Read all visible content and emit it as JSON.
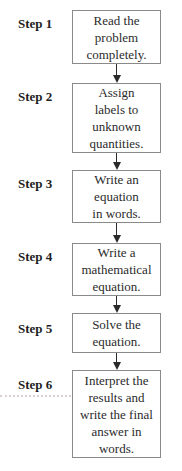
{
  "figure": {
    "type": "flowchart",
    "direction": "top-down"
  },
  "colors": {
    "background": "#ffffff",
    "box_border": "#8a8a8a",
    "text": "#2b2b2b",
    "label_text": "#1e1e1e",
    "arrow": "#2b2b2b",
    "dotted_rule": "#ddcfcf"
  },
  "steps": [
    {
      "label": "Step 1",
      "text": "Read the\nproblem\ncompletely."
    },
    {
      "label": "Step 2",
      "text": "Assign\nlabels to\nunknown\nquantities."
    },
    {
      "label": "Step 3",
      "text": "Write an\nequation\nin words."
    },
    {
      "label": "Step 4",
      "text": "Write a\nmathematical\nequation."
    },
    {
      "label": "Step 5",
      "text": "Solve the\nequation."
    },
    {
      "label": "Step 6",
      "text": "Interpret the\nresults and\nwrite the final\nanswer in\nwords."
    }
  ]
}
